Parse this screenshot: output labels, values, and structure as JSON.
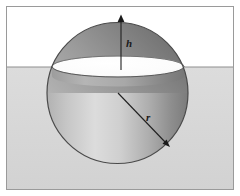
{
  "figure": {
    "labels": {
      "cap_height": "h",
      "radius": "r"
    },
    "colors": {
      "background": "#ffffff",
      "liquid": "#d6d6d6",
      "liquid_line": "#8e8e8e",
      "frame_border": "#9a9a9a",
      "sphere_light": "#efefef",
      "sphere_mid": "#b9b9b9",
      "sphere_dark": "#7d7d7d",
      "cap_top_light": "#c9c9c9",
      "cap_top_dark": "#6f6f6f",
      "disc_fill": "#fdfdfd",
      "outline": "#3a3a3a",
      "label_text": "#1a1a1a"
    },
    "geometry": {
      "frame": {
        "x": 6,
        "y": 6,
        "width": 228,
        "height": 184
      },
      "liquid_surface_y": 67,
      "sphere": {
        "cx": 117.5,
        "cy": 93,
        "r": 70.5
      },
      "cap_plane_ellipse": {
        "cx": 118,
        "cy": 66.5,
        "rx": 66,
        "ry": 10.5
      },
      "cap_height_arrow": {
        "x": 121,
        "y_top": 16,
        "y_bottom": 70
      },
      "radius_arrow": {
        "x1": 118,
        "y1": 93,
        "x2": 169,
        "y2": 146
      },
      "label_h_pos": {
        "x": 126,
        "y": 45
      },
      "label_r_pos": {
        "x": 148,
        "y": 118
      }
    }
  }
}
